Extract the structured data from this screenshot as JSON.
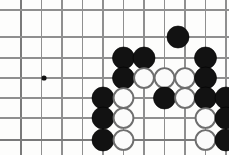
{
  "board": {
    "title": "Go board position",
    "cropped": true,
    "cell_size": 20.5,
    "stone_radius": 11,
    "colors": {
      "background": "#fdfdfc",
      "grid": "#8f8f8f",
      "grid_edge": "#7a7a7a",
      "black_stone": "#121212",
      "white_stone_fill": "#fbfbfb",
      "white_stone_edge": "#6e6e6e"
    },
    "vertical_lines_x": [
      21,
      41.5,
      62,
      82.5,
      103,
      123.5,
      144,
      164.5,
      185,
      205.5,
      226
    ],
    "horizontal_lines_y": [
      10,
      37,
      58,
      78,
      98,
      118,
      140
    ],
    "edge_lines": {
      "left_x": 21,
      "bottom_y": 140
    },
    "star_points": [
      {
        "x": 44,
        "y": 78,
        "name": "hoshi"
      }
    ],
    "stones": [
      {
        "color": "black",
        "x": 178,
        "y": 37
      },
      {
        "color": "black",
        "x": 123.5,
        "y": 58
      },
      {
        "color": "black",
        "x": 144,
        "y": 58
      },
      {
        "color": "black",
        "x": 205.5,
        "y": 58
      },
      {
        "color": "black",
        "x": 123.5,
        "y": 78
      },
      {
        "color": "white",
        "x": 144,
        "y": 78
      },
      {
        "color": "white",
        "x": 164.5,
        "y": 78
      },
      {
        "color": "white",
        "x": 185,
        "y": 78
      },
      {
        "color": "black",
        "x": 205.5,
        "y": 78
      },
      {
        "color": "black",
        "x": 103,
        "y": 98
      },
      {
        "color": "white",
        "x": 123.5,
        "y": 98
      },
      {
        "color": "black",
        "x": 164.5,
        "y": 98
      },
      {
        "color": "white",
        "x": 185,
        "y": 98
      },
      {
        "color": "black",
        "x": 205.5,
        "y": 98
      },
      {
        "color": "black",
        "x": 226,
        "y": 98
      },
      {
        "color": "black",
        "x": 103,
        "y": 118
      },
      {
        "color": "white",
        "x": 123.5,
        "y": 118
      },
      {
        "color": "white",
        "x": 205.5,
        "y": 118
      },
      {
        "color": "black",
        "x": 226,
        "y": 118
      },
      {
        "color": "black",
        "x": 103,
        "y": 140
      },
      {
        "color": "white",
        "x": 123.5,
        "y": 140
      },
      {
        "color": "white",
        "x": 205.5,
        "y": 140
      },
      {
        "color": "black",
        "x": 226,
        "y": 140
      }
    ]
  }
}
